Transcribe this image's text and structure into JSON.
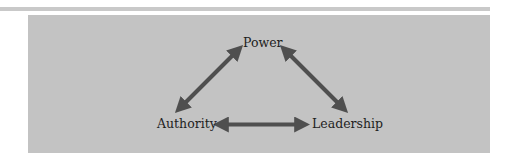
{
  "diagram": {
    "type": "triangle-relationship",
    "nodes": [
      {
        "id": "power",
        "label": "Power",
        "position": "top"
      },
      {
        "id": "authority",
        "label": "Authority",
        "position": "bottom-left"
      },
      {
        "id": "leadership",
        "label": "Leadership",
        "position": "bottom-right"
      }
    ],
    "edges": [
      {
        "from": "authority",
        "to": "power",
        "style": "double-headed-arrow"
      },
      {
        "from": "power",
        "to": "leadership",
        "style": "double-headed-arrow"
      },
      {
        "from": "authority",
        "to": "leadership",
        "style": "double-headed-arrow"
      }
    ],
    "colors": {
      "panel_background": "#c3c3c3",
      "arrow": "#4f4f4f",
      "text": "#1e1e1e",
      "top_rule": "#c9c9c9"
    }
  }
}
